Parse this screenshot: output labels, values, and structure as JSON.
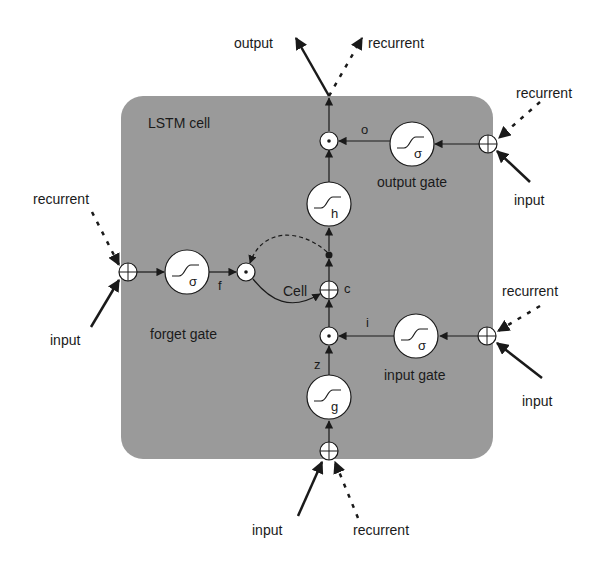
{
  "diagram": {
    "title": "LSTM cell",
    "colors": {
      "cell_fill": "#9a9a9a",
      "node_fill": "#ffffff",
      "stroke": "#1a1a1a",
      "background": "#ffffff"
    },
    "cell_label": "Cell",
    "gates": {
      "output": {
        "label": "output gate",
        "activation": "σ",
        "signal": "o"
      },
      "forget": {
        "label": "forget gate",
        "activation": "σ",
        "signal": "f"
      },
      "input": {
        "label": "input gate",
        "activation": "σ",
        "signal": "i"
      }
    },
    "block_input": {
      "activation": "g",
      "signal": "z"
    },
    "cell_state": {
      "signal": "c"
    },
    "output_activation": {
      "activation": "h"
    },
    "external": {
      "top_output": "output",
      "top_recurrent": "recurrent",
      "output_gate_recurrent": "recurrent",
      "output_gate_input": "input",
      "forget_gate_recurrent": "recurrent",
      "forget_gate_input": "input",
      "input_gate_recurrent": "recurrent",
      "input_gate_input": "input",
      "block_input": "input",
      "block_recurrent": "recurrent"
    }
  }
}
